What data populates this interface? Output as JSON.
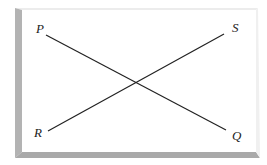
{
  "diagram": {
    "segments": [
      {
        "name": "PQ",
        "from": "P",
        "to": "Q"
      },
      {
        "name": "RS",
        "from": "R",
        "to": "S"
      }
    ],
    "points": [
      {
        "id": "P",
        "label": "P"
      },
      {
        "id": "Q",
        "label": "Q"
      },
      {
        "id": "R",
        "label": "R"
      },
      {
        "id": "S",
        "label": "S"
      }
    ],
    "colors": {
      "line": "#222222",
      "frame_shadow": "#a9a9a9",
      "frame_light": "#e6e6e6",
      "background": "#ffffff"
    }
  }
}
